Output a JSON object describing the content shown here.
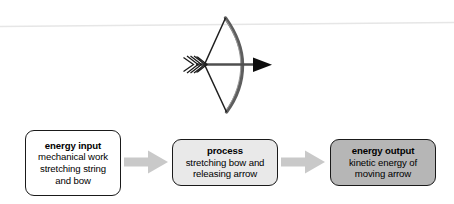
{
  "page": {
    "background_color": "#ffffff"
  },
  "illustration": {
    "name": "bow-and-arrow",
    "description": "A drawn bow with nocked arrow pointing right",
    "parts": [
      {
        "name": "bow-limb",
        "color": "#595959"
      },
      {
        "name": "bow-string",
        "color": "#1a1a1a"
      },
      {
        "name": "arrow-shaft",
        "color": "#4d4d4d"
      },
      {
        "name": "arrow-head",
        "color": "#000000"
      },
      {
        "name": "arrow-fletching",
        "color": "#1a1a1a"
      },
      {
        "name": "horizon-line",
        "color": "#e4e4e4"
      }
    ]
  },
  "flow": {
    "arrow_color": "#c9c9c9",
    "nodes": [
      {
        "id": "energy-input",
        "title": "energy input",
        "lines": [
          "mechanical work",
          "stretching string",
          "and bow"
        ],
        "fill": "#ffffff",
        "border": "#1a1a1a"
      },
      {
        "id": "process",
        "title": "process",
        "lines": [
          "stretching bow and",
          "releasing arrow"
        ],
        "fill": "#e9e9e9",
        "border": "#1a1a1a"
      },
      {
        "id": "energy-output",
        "title": "energy output",
        "lines": [
          "kinetic energy of",
          "moving arrow"
        ],
        "fill": "#b6b6b6",
        "border": "#1a1a1a"
      }
    ],
    "connectors": [
      {
        "id": "connector-1",
        "from": "energy-input",
        "to": "process"
      },
      {
        "id": "connector-2",
        "from": "process",
        "to": "energy-output"
      }
    ]
  }
}
